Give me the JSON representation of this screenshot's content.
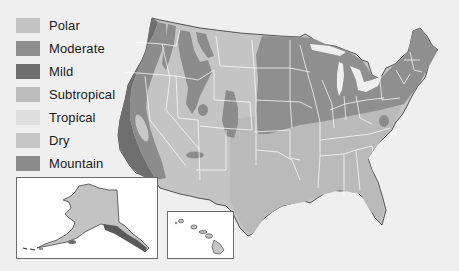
{
  "map": {
    "subject": "Climate regions of the United States",
    "background_color": "#efefef",
    "state_border_color": "#ffffff",
    "coast_color": "#333333"
  },
  "legend": {
    "items": [
      {
        "label": "Polar",
        "color": "#c3c3c3"
      },
      {
        "label": "Moderate",
        "color": "#8e8e8e"
      },
      {
        "label": "Mild",
        "color": "#6e6e6e"
      },
      {
        "label": "Subtropical",
        "color": "#bcbcbc"
      },
      {
        "label": "Tropical",
        "color": "#dedede"
      },
      {
        "label": "Dry",
        "color": "#c6c6c6"
      },
      {
        "label": "Mountain",
        "color": "#8c8c8c"
      }
    ]
  },
  "insets": {
    "alaska": {
      "label": "Alaska"
    },
    "hawaii": {
      "label": "Hawaii"
    }
  }
}
